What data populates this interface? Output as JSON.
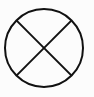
{
  "symbol": {
    "name": "circle-with-x",
    "stroke_color": "#111111",
    "background_color": "#fcfcfc",
    "center": [
      44,
      48
    ],
    "radius": 39,
    "stroke_width": 2
  }
}
